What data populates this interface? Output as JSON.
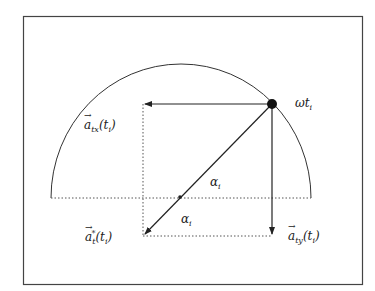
{
  "diagram": {
    "type": "vector decomposition on semicircle",
    "colors": {
      "stroke": "#333333",
      "background": "#ffffff",
      "frame": "#444444"
    },
    "labels": {
      "point": {
        "base": "ωt",
        "sub": "i"
      },
      "atx": {
        "vec": "a",
        "sub": "tx",
        "arg": "(t",
        "argsub": "i",
        "close": ")"
      },
      "aty": {
        "vec": "a",
        "sub": "ty",
        "arg": "(t",
        "argsub": "i",
        "close": ")"
      },
      "at_star": {
        "vec": "a",
        "sub": "t",
        "sup": "*",
        "arg": "(t",
        "argsub": "i",
        "close": ")"
      },
      "alpha_upper": {
        "base": "α",
        "sub": "i"
      },
      "alpha_lower": {
        "base": "α",
        "sub": "i"
      }
    }
  }
}
